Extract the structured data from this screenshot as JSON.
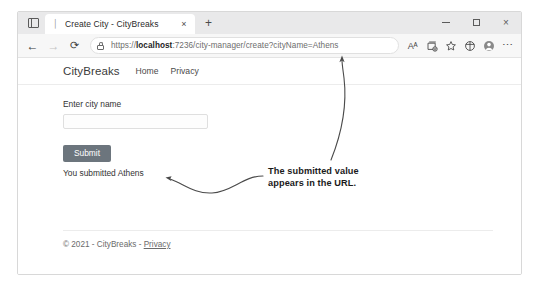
{
  "browser": {
    "tab_actions_icon": "vertical-tabs-icon",
    "tab": {
      "favicon": "page-icon",
      "title": "Create City - CityBreaks",
      "close_label": "×"
    },
    "new_tab_label": "+",
    "window_controls": {
      "minimize": "minimize",
      "maximize": "maximize",
      "close": "×"
    },
    "nav": {
      "back": "←",
      "forward": "→",
      "reload": "⟳"
    },
    "omnibox": {
      "lock_icon": "lock-icon",
      "url_scheme": "https://",
      "url_host_bold": "localhost",
      "url_rest": ":7236/city-manager/create?cityName=Athens",
      "url_full": "https://localhost:7236/city-manager/create?cityName=Athens"
    },
    "toolbar_icons": {
      "read_aloud": "Aᴬ",
      "collections": "collections-icon",
      "favorites": "star-icon",
      "browser_essentials": "split-screen-icon",
      "profile": "profile-avatar-icon",
      "settings_more": "⋯"
    }
  },
  "page": {
    "brand": "CityBreaks",
    "nav_links": [
      {
        "label": "Home"
      },
      {
        "label": "Privacy"
      }
    ],
    "form": {
      "label": "Enter city name",
      "input_value": "",
      "input_placeholder": "",
      "submit_label": "Submit"
    },
    "result_text": "You submitted Athens",
    "footer": {
      "copyright": "© 2021 - CityBreaks - ",
      "privacy_link": "Privacy"
    }
  },
  "annotation": {
    "line1": "The submitted value",
    "line2": "appears in the URL.",
    "arrow_to_url": "curved-arrow-up-icon",
    "arrow_to_result": "curved-arrow-left-icon",
    "ink_color": "#4a4a4a"
  }
}
